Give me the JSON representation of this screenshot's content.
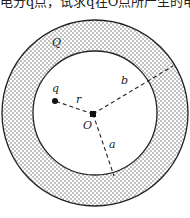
{
  "header": {
    "cut_text": "电分q点，试求q在O点所产生的电势。"
  },
  "diagram": {
    "labels": {
      "Q": "Q",
      "q": "q",
      "r": "r",
      "b": "b",
      "O": "O",
      "a": "a"
    },
    "outer_circle": {
      "cx": 95,
      "cy": 113,
      "r": 93
    },
    "inner_circle": {
      "cx": 95,
      "cy": 113,
      "r": 62
    },
    "center_point": {
      "x": 93,
      "y": 114
    },
    "charge_point": {
      "x": 55,
      "y": 101
    },
    "shell_fill": "#dotted",
    "line_color": "#222222"
  }
}
